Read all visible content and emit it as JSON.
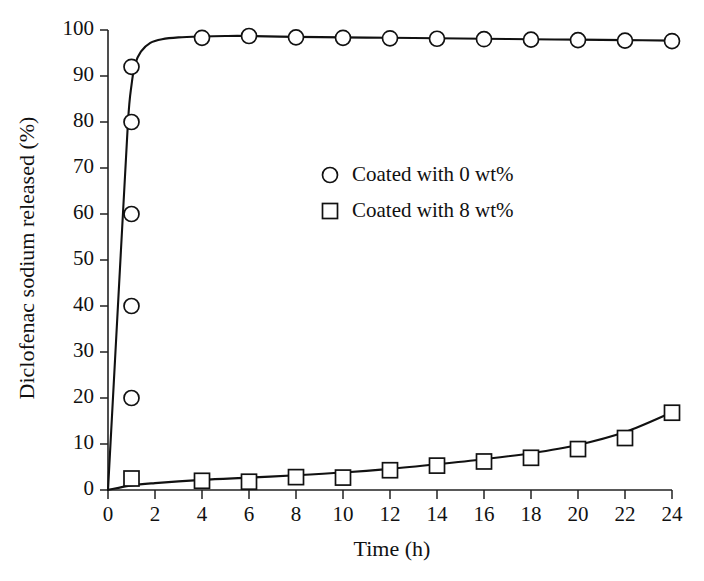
{
  "chart_data": {
    "type": "scatter",
    "title": "",
    "xlabel": "Time (h)",
    "ylabel": "Diclofenac sodium released (%)",
    "xlim": [
      0,
      24
    ],
    "ylim": [
      0,
      100
    ],
    "xticks": [
      0,
      2,
      4,
      6,
      8,
      10,
      12,
      14,
      16,
      18,
      20,
      22,
      24
    ],
    "yticks": [
      0,
      10,
      20,
      30,
      40,
      50,
      60,
      70,
      80,
      90,
      100
    ],
    "xtick_labels": [
      "0",
      "2",
      "4",
      "6",
      "8",
      "10",
      "12",
      "14",
      "16",
      "18",
      "20",
      "22",
      "24"
    ],
    "ytick_labels": [
      "0",
      "10",
      "20",
      "30",
      "40",
      "50",
      "60",
      "70",
      "80",
      "90",
      "100"
    ],
    "grid": false,
    "legend_position": "center-right",
    "series": [
      {
        "name": "Coated with 0 wt%",
        "marker": "circle",
        "color": "#111111",
        "x": [
          1,
          1,
          1,
          1,
          1,
          4,
          6,
          8,
          10,
          12,
          14,
          16,
          18,
          20,
          22,
          24
        ],
        "values": [
          20,
          40,
          60,
          80,
          92,
          98.3,
          98.7,
          98.4,
          98.3,
          98.2,
          98.1,
          98.0,
          97.9,
          97.8,
          97.7,
          97.6
        ],
        "fit_curve": {
          "x": [
            0,
            0.55,
            0.85,
            1.0,
            1.15,
            1.4,
            1.8,
            2.3,
            3.0,
            4.0,
            5.0,
            6.0,
            8.0,
            10,
            12,
            14,
            16,
            18,
            20,
            22,
            24
          ],
          "y": [
            0,
            52,
            80,
            88,
            92.5,
            95.3,
            97.2,
            98.0,
            98.4,
            98.6,
            98.7,
            98.7,
            98.5,
            98.4,
            98.3,
            98.2,
            98.1,
            98.0,
            97.9,
            97.8,
            97.7
          ]
        }
      },
      {
        "name": "Coated with 8 wt%",
        "marker": "square",
        "color": "#111111",
        "x": [
          1,
          4,
          6,
          8,
          10,
          12,
          14,
          16,
          18,
          20,
          22,
          24
        ],
        "values": [
          2.5,
          2.0,
          1.8,
          2.8,
          2.7,
          4.3,
          5.3,
          6.2,
          7.0,
          8.9,
          11.3,
          16.8
        ],
        "fit_curve": {
          "x": [
            0,
            1,
            2,
            4,
            6,
            8,
            10,
            12,
            14,
            16,
            18,
            20,
            22,
            24
          ],
          "y": [
            0,
            1.0,
            1.5,
            2.2,
            2.7,
            3.2,
            3.8,
            4.6,
            5.6,
            6.7,
            8.0,
            9.8,
            12.6,
            16.9
          ]
        }
      }
    ]
  },
  "legend": {
    "entries": [
      {
        "label": "Coated with 0 wt%",
        "marker": "circle"
      },
      {
        "label": "Coated with 8 wt%",
        "marker": "square"
      }
    ]
  }
}
